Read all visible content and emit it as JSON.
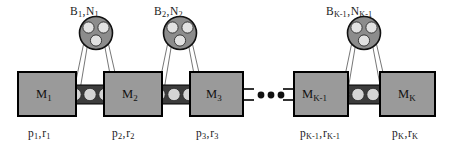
{
  "figure": {
    "colors": {
      "machine_fill": "#9a9a9a",
      "machine_stroke": "#000000",
      "buffer_band": "#3c3c3c",
      "buffer_ball": "#d0d0d0",
      "pulley_fill": "#8c8c8c",
      "pulley_roller": "#e0e0e0",
      "belt_stroke": "#555555",
      "text": "#1a1a1a",
      "background": "#ffffff"
    }
  },
  "machines": [
    {
      "name": "M",
      "index": "1",
      "label": "M₁"
    },
    {
      "name": "M",
      "index": "2",
      "label": "M₂"
    },
    {
      "name": "M",
      "index": "3",
      "label": "M₃"
    },
    {
      "name": "M",
      "index": "K-1",
      "label": "M_{K-1}"
    },
    {
      "name": "M",
      "index": "K",
      "label": "M_K"
    }
  ],
  "pulleys": [
    {
      "b": "B",
      "b_index": "1",
      "n": "N",
      "n_index": "1",
      "label": "B₁, N₁"
    },
    {
      "b": "B",
      "b_index": "2",
      "n": "N",
      "n_index": "2",
      "label": "B₂, N₂"
    },
    {
      "b": "B",
      "b_index": "K-1",
      "n": "N",
      "n_index": "K-1",
      "label": "B_{K-1}, N_{K-1}"
    }
  ],
  "parameters": [
    {
      "p": "p",
      "p_index": "1",
      "r": "r",
      "r_index": "1",
      "label": "p₁, r₁"
    },
    {
      "p": "p",
      "p_index": "2",
      "r": "r",
      "r_index": "2",
      "label": "p₂, r₂"
    },
    {
      "p": "p",
      "p_index": "3",
      "r": "r",
      "r_index": "3",
      "label": "p₃, r₃"
    },
    {
      "p": "p",
      "p_index": "K-1",
      "r": "r",
      "r_index": "K-1",
      "label": "p_{K-1}, r_{K-1}"
    },
    {
      "p": "p",
      "p_index": "K",
      "r": "r",
      "r_index": "K",
      "label": "p_K, r_K"
    }
  ],
  "separator": ",",
  "ellipsis": "•••",
  "buffers": [
    {
      "balls": 3
    },
    {
      "balls": 3
    },
    {
      "balls": 3
    }
  ]
}
